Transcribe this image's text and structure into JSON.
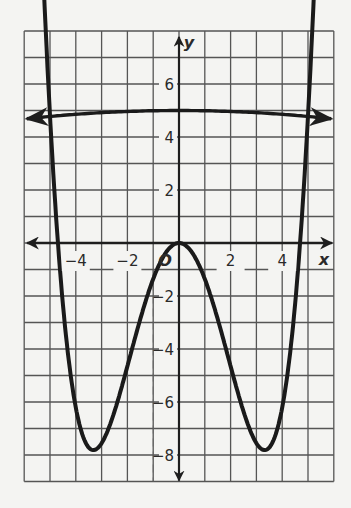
{
  "chart_data": {
    "type": "line",
    "title": "",
    "xlabel": "x",
    "ylabel": "y",
    "origin_label": "O",
    "xlim": [
      -6,
      6
    ],
    "ylim": [
      -9,
      8
    ],
    "grid": true,
    "x_ticks": [
      {
        "value": -4,
        "label": "−4"
      },
      {
        "value": -2,
        "label": "−2"
      },
      {
        "value": 2,
        "label": "2"
      },
      {
        "value": 4,
        "label": "4"
      }
    ],
    "y_ticks": [
      {
        "value": 6,
        "label": "6"
      },
      {
        "value": 4,
        "label": "4"
      },
      {
        "value": 2,
        "label": "2"
      },
      {
        "value": -2,
        "label": "−2"
      },
      {
        "value": -4,
        "label": "−4"
      },
      {
        "value": -6,
        "label": "−6"
      },
      {
        "value": -8,
        "label": "−8"
      }
    ],
    "series": [
      {
        "name": "quartic curve",
        "description": "W-shaped quartic: double root at origin, roots near x=±4.7, minima near (±3.3, −7.8), arrows at both ends",
        "x": [
          -5.6,
          -5,
          -4.7,
          -4,
          -3.3,
          -3,
          -2,
          -1,
          0,
          1,
          2,
          3,
          3.3,
          4,
          4.7,
          5,
          5.6
        ],
        "y": [
          8.1,
          4.8,
          0,
          -5.3,
          -7.8,
          -7.5,
          -4.6,
          -1.4,
          0,
          -1.4,
          -4.6,
          -7.5,
          -7.8,
          -5.3,
          0,
          4.8,
          8.1
        ]
      },
      {
        "name": "nearly horizontal curve",
        "description": "Slightly arched curve near y≈5, arrows at both ends",
        "x": [
          -5.8,
          -4,
          -2,
          0,
          2,
          4,
          5.8
        ],
        "y": [
          4.7,
          4.85,
          4.97,
          5.0,
          4.97,
          4.85,
          4.7
        ]
      }
    ]
  }
}
